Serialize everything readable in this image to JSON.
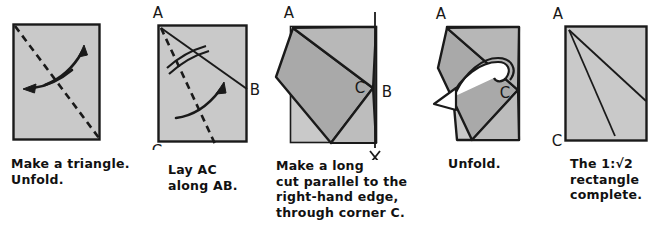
{
  "figure": {
    "paper_fill": "#c9c9c9",
    "paper_fill_dark": "#a8a8a8",
    "ink": "#1a1a1a",
    "background": "#ffffff"
  },
  "panels": [
    {
      "id": "panel-1",
      "index": 1,
      "caption": "Make a triangle.\nUnfold.",
      "caption_lines": [
        "Make a triangle.",
        "Unfold."
      ],
      "corner_labels": [],
      "annotations": {
        "crease_style": "dashed-diagonal",
        "arrow_count": 2,
        "arrow_kind": "fold-and-unfold"
      }
    },
    {
      "id": "panel-2",
      "index": 2,
      "caption": "Lay AC\nalong AB.",
      "caption_lines": [
        "Lay AC",
        "along AB."
      ],
      "corner_labels": [
        {
          "name": "A",
          "position": "top-left-outside"
        },
        {
          "name": "B",
          "position": "right-edge-outside"
        },
        {
          "name": "C",
          "position": "bottom-left-outside"
        }
      ],
      "annotations": {
        "crease_style": "dashed-bisector",
        "equal_angle_marks": 2,
        "arrow_count": 1,
        "arrow_kind": "fold"
      }
    },
    {
      "id": "panel-3",
      "index": 3,
      "caption": "Make a long\ncut parallel to the\nright-hand edge,\nthrough corner C.",
      "caption_lines": [
        "Make a long",
        "cut parallel to the",
        "right-hand edge,",
        "through corner C."
      ],
      "corner_labels": [
        {
          "name": "A",
          "position": "top-left-outside"
        },
        {
          "name": "B",
          "position": "right-edge-outside"
        },
        {
          "name": "C",
          "position": "interior-near-right"
        }
      ],
      "annotations": {
        "cut_line": "vertical",
        "tool": "scissors",
        "tool_icon": "scissors-icon"
      }
    },
    {
      "id": "panel-4",
      "index": 4,
      "caption": "Unfold.",
      "caption_lines": [
        "Unfold."
      ],
      "corner_labels": [
        {
          "name": "A",
          "position": "top-left-outside"
        },
        {
          "name": "C",
          "position": "interior-near-right"
        }
      ],
      "annotations": {
        "arrow_count": 1,
        "arrow_kind": "unfold-hollow"
      }
    },
    {
      "id": "panel-5",
      "index": 5,
      "caption": "The 1:√2\nrectangle\ncomplete.",
      "caption_lines": [
        "The 1:√2",
        "rectangle",
        "complete."
      ],
      "corner_labels": [
        {
          "name": "A",
          "position": "top-left-outside"
        },
        {
          "name": "C",
          "position": "bottom-left-outside"
        }
      ],
      "annotations": {
        "crease_style": "two-solid-creases",
        "result_ratio": "1:√2"
      }
    }
  ],
  "captions": {
    "p1": "Make a triangle.\nUnfold.",
    "p2": "Lay AC\nalong AB.",
    "p3": "Make a long\ncut parallel to the\nright-hand edge,\nthrough corner C.",
    "p4": "Unfold.",
    "p5": "The 1:√2\nrectangle\ncomplete."
  },
  "labels": {
    "A": "A",
    "B": "B",
    "C": "C"
  }
}
